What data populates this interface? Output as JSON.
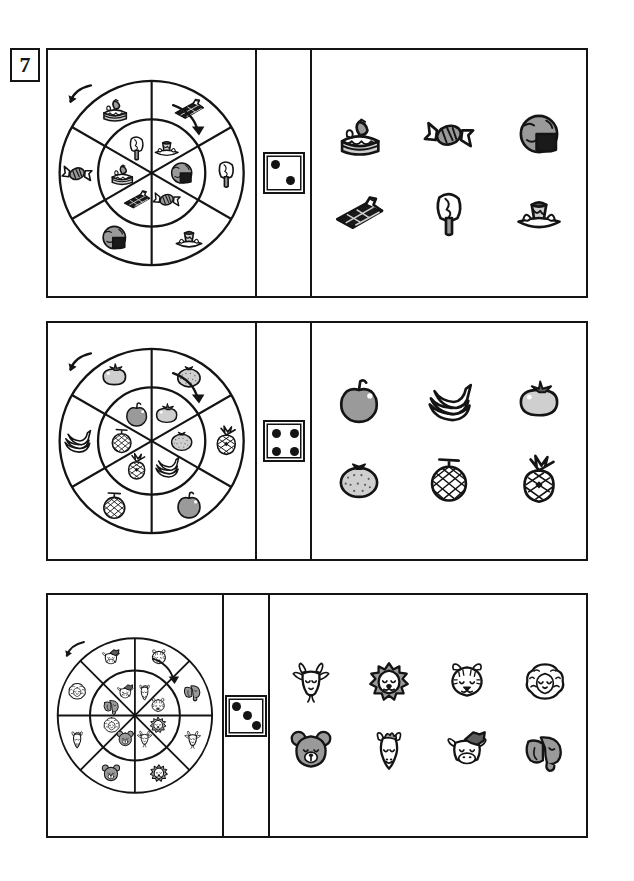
{
  "worksheet": {
    "exercise_number": "7",
    "colors": {
      "ink": "#141414",
      "paper": "#ffffff",
      "gray_mid": "#9a9a9a",
      "gray_light": "#cfcfcf",
      "gray_dark": "#5d5d5d",
      "black_fill": "#1a1a1a"
    }
  },
  "rows": [
    {
      "id": "row-sweets",
      "theme": "sweets",
      "spinner": {
        "name": "sweets-spinner",
        "sectors": 6,
        "rings": 2,
        "arrows": [
          {
            "name": "rotation-arrow-outer-left",
            "direction": "counter-clockwise",
            "position": "upper-left"
          },
          {
            "name": "rotation-arrow-inner-right",
            "direction": "clockwise",
            "position": "upper-right"
          }
        ],
        "outer_ring_items": [
          "strawberry-cake",
          "wrapped-candy",
          "chocolate-round-cake",
          "pudding-plate",
          "popsicle",
          "chocolate-bar"
        ],
        "inner_ring_items": [
          "popsicle",
          "strawberry-cake",
          "chocolate-bar",
          "wrapped-candy",
          "chocolate-round-cake",
          "pudding-plate"
        ]
      },
      "die": {
        "name": "die-two",
        "pips": 2,
        "face_value": "2"
      },
      "items": {
        "columns": 3,
        "list": [
          {
            "name": "strawberry-cake",
            "label": "Strawberry cake"
          },
          {
            "name": "wrapped-candy",
            "label": "Wrapped candy"
          },
          {
            "name": "chocolate-round-cake",
            "label": "Chocolate round cake"
          },
          {
            "name": "chocolate-bar",
            "label": "Chocolate bar"
          },
          {
            "name": "popsicle",
            "label": "Popsicle"
          },
          {
            "name": "pudding-plate",
            "label": "Pudding on plate"
          }
        ]
      }
    },
    {
      "id": "row-fruits",
      "theme": "fruits",
      "spinner": {
        "name": "fruits-spinner",
        "sectors": 6,
        "rings": 2,
        "arrows": [
          {
            "name": "rotation-arrow-outer-left",
            "direction": "counter-clockwise",
            "position": "upper-left"
          },
          {
            "name": "rotation-arrow-inner-right",
            "direction": "clockwise",
            "position": "upper-right"
          }
        ],
        "outer_ring_items": [
          "persimmon",
          "bananas",
          "melon",
          "apple",
          "pineapple",
          "mandarin"
        ],
        "inner_ring_items": [
          "apple",
          "melon",
          "pineapple",
          "bananas",
          "mandarin",
          "persimmon"
        ]
      },
      "die": {
        "name": "die-four",
        "pips": 4,
        "face_value": "4"
      },
      "items": {
        "columns": 3,
        "list": [
          {
            "name": "apple",
            "label": "Apple"
          },
          {
            "name": "bananas",
            "label": "Bananas"
          },
          {
            "name": "persimmon",
            "label": "Persimmon"
          },
          {
            "name": "mandarin",
            "label": "Mandarin orange"
          },
          {
            "name": "melon",
            "label": "Melon"
          },
          {
            "name": "pineapple",
            "label": "Pineapple"
          }
        ]
      }
    },
    {
      "id": "row-animals",
      "theme": "animals",
      "spinner": {
        "name": "animals-spinner",
        "sectors": 8,
        "rings": 2,
        "arrows": [
          {
            "name": "rotation-arrow-outer-left",
            "direction": "counter-clockwise",
            "position": "upper-left"
          },
          {
            "name": "rotation-arrow-inner-right",
            "direction": "clockwise",
            "position": "upper-right"
          }
        ],
        "outer_ring_items": [
          "cow",
          "sheep",
          "horse",
          "bear",
          "lion",
          "goat",
          "elephant",
          "tiger"
        ],
        "inner_ring_items": [
          "cow",
          "elephant",
          "sheep",
          "bear",
          "goat",
          "lion",
          "tiger",
          "horse"
        ]
      },
      "die": {
        "name": "die-three",
        "pips": 3,
        "face_value": "3"
      },
      "items": {
        "columns": 4,
        "list": [
          {
            "name": "goat",
            "label": "Goat"
          },
          {
            "name": "lion",
            "label": "Lion"
          },
          {
            "name": "tiger",
            "label": "Tiger"
          },
          {
            "name": "sheep",
            "label": "Sheep"
          },
          {
            "name": "bear",
            "label": "Bear"
          },
          {
            "name": "horse",
            "label": "Horse"
          },
          {
            "name": "cow",
            "label": "Cow"
          },
          {
            "name": "elephant",
            "label": "Elephant"
          }
        ]
      }
    }
  ]
}
